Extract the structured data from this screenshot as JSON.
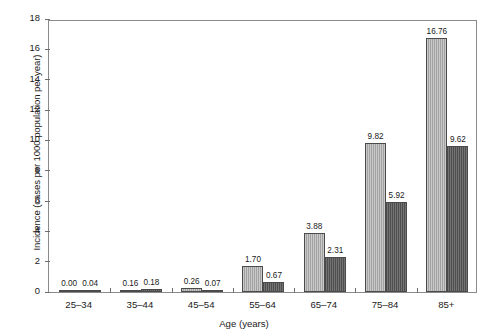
{
  "chart_data": {
    "type": "bar",
    "title": "",
    "xlabel": "Age (years)",
    "ylabel": "Incidence (cases per 1000 population per year)",
    "categories": [
      "25–34",
      "35–44",
      "45–54",
      "55–64",
      "65–74",
      "75–84",
      "85+"
    ],
    "series": [
      {
        "name": "light",
        "color": "#a6a6a6",
        "values": [
          0.0,
          0.16,
          0.26,
          1.7,
          3.88,
          9.82,
          16.76
        ],
        "labels": [
          "0.00",
          "0.16",
          "0.26",
          "1.70",
          "3.88",
          "9.82",
          "16.76"
        ]
      },
      {
        "name": "dark",
        "color": "#585858",
        "values": [
          0.04,
          0.18,
          0.07,
          0.67,
          2.31,
          5.92,
          9.62
        ],
        "labels": [
          "0.04",
          "0.18",
          "0.07",
          "0.67",
          "2.31",
          "5.92",
          "9.62"
        ]
      }
    ],
    "ylim": [
      0,
      18
    ],
    "yticks": [
      0,
      2,
      4,
      6,
      8,
      10,
      12,
      14,
      16,
      18
    ],
    "ytick_labels": [
      "0",
      "2",
      "4",
      "6",
      "8",
      "10",
      "12",
      "14",
      "16",
      "18"
    ],
    "grid": false,
    "legend": "none"
  }
}
